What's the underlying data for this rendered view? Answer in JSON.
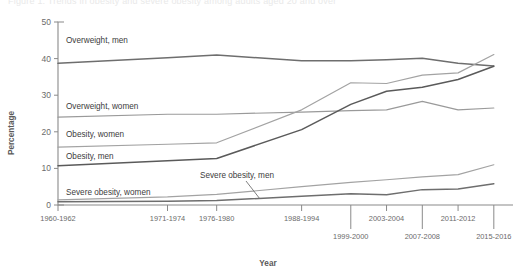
{
  "figure": {
    "cut_off_title": "Figure 1. Trends in obesity and severe obesity among adults aged 20 and over",
    "xlabel": "Year",
    "ylabel": "Percentage"
  },
  "chart_data": {
    "type": "line",
    "title": "",
    "xlabel": "Year",
    "ylabel": "Percentage",
    "ylim": [
      0,
      50
    ],
    "yticks": [
      0,
      10,
      20,
      30,
      40,
      50
    ],
    "grid": false,
    "legend_position": "inline-labels",
    "categories": [
      "1960-1962",
      "1971-1974",
      "1976-1980",
      "1988-1994",
      "1999-2000",
      "2003-2004",
      "2007-2008",
      "2011-2012",
      "2015-2016"
    ],
    "xtick_rows": {
      "upper": [
        "1960-1962",
        "1971-1974",
        "1976-1980",
        "1988-1994",
        "2003-2004",
        "2011-2012"
      ],
      "lower": [
        "1999-2000",
        "2007-2008",
        "2015-2016"
      ]
    },
    "series": [
      {
        "name": "Overweight, men",
        "color": "#6e6e6e",
        "label": "Overweight, men",
        "values": [
          38.7,
          40.2,
          41.0,
          39.4,
          39.4,
          39.7,
          40.1,
          38.7,
          38.0
        ]
      },
      {
        "name": "Overweight, women",
        "color": "#9a9a9a",
        "label": "Overweight, women",
        "values": [
          24.0,
          24.8,
          24.8,
          25.4,
          25.8,
          26.0,
          28.3,
          26.0,
          26.5
        ]
      },
      {
        "name": "Obesity, women",
        "color": "#a3a3a3",
        "label": "Obesity, women",
        "values": [
          15.8,
          16.6,
          17.0,
          26.0,
          33.4,
          33.2,
          35.5,
          36.1,
          41.1
        ]
      },
      {
        "name": "Obesity, men",
        "color": "#5a5a5a",
        "label": "Obesity, men",
        "values": [
          10.7,
          12.1,
          12.7,
          20.6,
          27.5,
          31.1,
          32.2,
          34.3,
          37.9
        ]
      },
      {
        "name": "Severe obesity, women",
        "color": "#a3a3a3",
        "label": "Severe obesity, women",
        "values": [
          1.4,
          2.2,
          2.9,
          5.0,
          6.2,
          6.9,
          7.7,
          8.3,
          11.0
        ]
      },
      {
        "name": "Severe obesity, men",
        "color": "#6e6e6e",
        "label": "Severe obesity, men",
        "values": [
          0.9,
          1.0,
          1.2,
          2.4,
          3.1,
          2.8,
          4.2,
          4.4,
          5.8
        ]
      }
    ]
  }
}
